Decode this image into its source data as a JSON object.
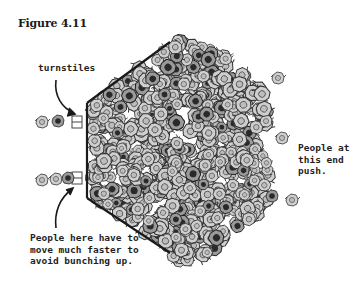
{
  "figure": {
    "title": "Figure 4.11"
  },
  "labels": {
    "turnstiles": "turnstiles",
    "push_end": "People at\nthis end\npush.",
    "exit_note": "People here have to\nmove much faster to\navoid bunching up."
  },
  "colors": {
    "ink": "#1a1a1a",
    "person_fill": "#c8c8c8",
    "person_dark": "#3a3a3a",
    "background": "#ffffff"
  },
  "diagram": {
    "barrier": {
      "top_diagonal": [
        [
          170,
          42
        ],
        [
          87,
          103
        ]
      ],
      "vertical": [
        [
          87,
          103
        ],
        [
          87,
          198
        ]
      ],
      "bottom_diagonal": [
        [
          87,
          198
        ],
        [
          170,
          253
        ]
      ]
    },
    "turnstiles": [
      {
        "x": 76,
        "y": 122
      },
      {
        "x": 76,
        "y": 178
      }
    ]
  }
}
